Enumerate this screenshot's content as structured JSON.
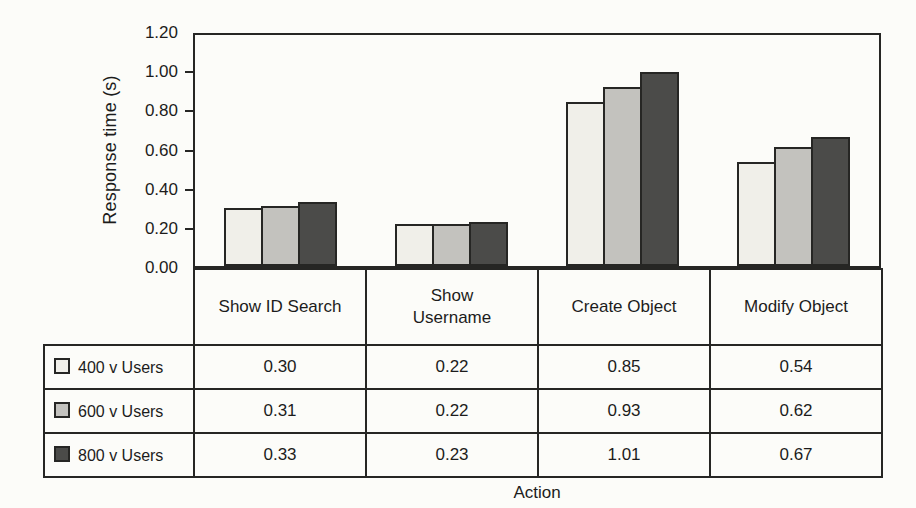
{
  "colors": {
    "paper": "#fcfcf9",
    "border": "#262624",
    "text": "#1c1c1c",
    "series": [
      "#f0efe9",
      "#c3c2be",
      "#4b4b49"
    ]
  },
  "chart_data": {
    "type": "bar",
    "title": "",
    "xlabel": "Action",
    "ylabel": "Response time (s)",
    "ylim": [
      0,
      1.2
    ],
    "ytick_labels": [
      "1.20",
      "1.00",
      "0.80",
      "0.60",
      "0.40",
      "0.20",
      "0.00"
    ],
    "grid": false,
    "legend_position": "data-table-left-column",
    "data_table_shown": true,
    "categories": [
      "Show ID Search",
      "Show\nUsername",
      "Create Object",
      "Modify Object"
    ],
    "series": [
      {
        "name": "400 v Users",
        "color": "#f0efe9",
        "values": [
          0.3,
          0.22,
          0.85,
          0.54
        ]
      },
      {
        "name": "600 v Users",
        "color": "#c3c2be",
        "values": [
          0.31,
          0.22,
          0.93,
          0.62
        ]
      },
      {
        "name": "800 v Users",
        "color": "#4b4b49",
        "values": [
          0.33,
          0.23,
          1.01,
          0.67
        ]
      }
    ]
  }
}
